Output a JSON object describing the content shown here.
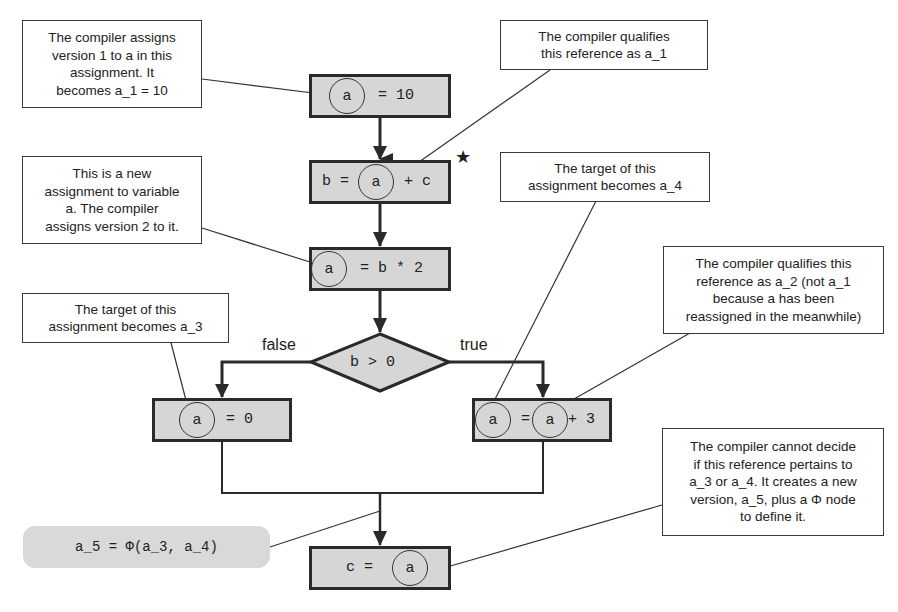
{
  "notes": {
    "n1": [
      "The compiler assigns",
      "version 1 to a in this",
      "assignment. It",
      "becomes a_1 = 10"
    ],
    "n2": [
      "The compiler qualifies",
      "this reference as a_1"
    ],
    "n3": [
      "This is a new",
      "assignment to variable",
      "a. The compiler",
      "assigns version 2 to it."
    ],
    "n4": [
      "The target of this",
      "assignment becomes a_4"
    ],
    "n5": [
      "The target of this",
      "assignment becomes a_3"
    ],
    "n6": [
      "The compiler qualifies this",
      "reference as a_2 (not a_1",
      "because a has been",
      "reassigned in the meanwhile)"
    ],
    "n7": [
      "The compiler cannot decide",
      "if this reference pertains to",
      "a_3 or a_4. It creates a new",
      "version, a_5, plus a Φ node",
      "to define it."
    ]
  },
  "nodes": {
    "box1": {
      "var": "a",
      "rest": "= 10"
    },
    "box2": {
      "pre": "b =",
      "var": "a",
      "rest": "+ c"
    },
    "box3": {
      "var": "a",
      "rest": "= b * 2"
    },
    "cond": {
      "text": "b > 0"
    },
    "left": {
      "var": "a",
      "rest": "= 0"
    },
    "right": {
      "var": "a",
      "eq": "=",
      "var2": "a",
      "rest": "+ 3"
    },
    "final": {
      "pre": "c =",
      "var": "a"
    }
  },
  "branch_labels": {
    "false": "false",
    "true": "true"
  },
  "phi": {
    "text": "a_5 = Φ(a_3, a_4)"
  },
  "marker": {
    "star": "★"
  },
  "colors": {
    "node_fill": "#d6d6d6",
    "border": "#2a2a2a",
    "phi_fill": "#d9d9d9"
  }
}
